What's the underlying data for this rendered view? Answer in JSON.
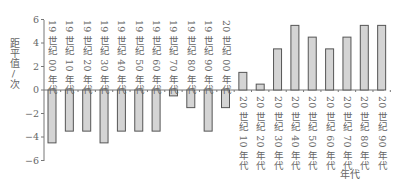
{
  "chart_data": {
    "type": "bar",
    "title": "",
    "xlabel": "年代",
    "ylabel": "距平值/次",
    "ylim": [
      -6,
      6
    ],
    "yticks": [
      6,
      4,
      2,
      0,
      -2,
      -4,
      -6
    ],
    "ytick_labels": [
      "6",
      "4",
      "2",
      "0",
      "−2",
      "−4",
      "−6"
    ],
    "grid": false,
    "legend": "none",
    "categories": [
      "19 世纪 00 年代",
      "19 世纪 10 年代",
      "19 世纪 20 年代",
      "19 世纪 30 年代",
      "19 世纪 40 年代",
      "19 世纪 50 年代",
      "19 世纪 60 年代",
      "19 世纪 70 年代",
      "19 世纪 80 年代",
      "19 世纪 90 年代",
      "20 世纪 00 年代",
      "20 世纪 10 年代",
      "20 世纪 20 年代",
      "20 世纪 30 年代",
      "20 世纪 40 年代",
      "20 世纪 50 年代",
      "20 世纪 60 年代",
      "20 世纪 70 年代",
      "20 世纪 80 年代",
      "20 世纪 90 年代"
    ],
    "values": [
      -4.5,
      -3.5,
      -3.5,
      -4.5,
      -3.5,
      -3.5,
      -3.5,
      -0.5,
      -1.5,
      -3.5,
      -1.5,
      1.5,
      0.5,
      3.5,
      5.5,
      4.5,
      3.5,
      4.5,
      5.5,
      5.5
    ],
    "colors": {
      "bar_fill": "#d4d4d4",
      "bar_stroke": "#555555",
      "axis": "#777777"
    }
  }
}
